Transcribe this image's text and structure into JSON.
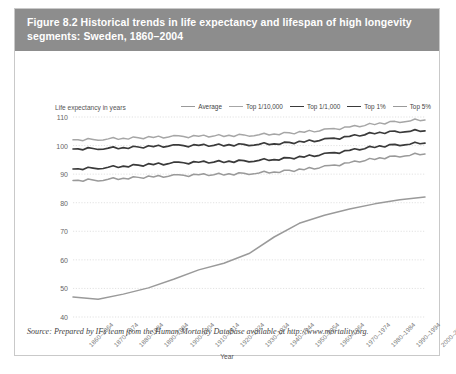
{
  "figure": {
    "title": "Figure 8.2 Historical trends in life expectancy and lifespan of high longevity segments: Sweden, 1860–2004",
    "source": "Source: Prepared by IFs team from the Human Mortality Database available at http://www.mortality.org."
  },
  "chart_data": {
    "type": "line",
    "title": "Figure 8.2 Historical trends in life expectancy and lifespan of high longevity segments: Sweden, 1860–2004",
    "xlabel": "Year",
    "ylabel": "Life expectancy in years",
    "ylim": [
      40,
      110
    ],
    "yticks": [
      40,
      50,
      60,
      70,
      80,
      90,
      100,
      110
    ],
    "grid": "horizontal-dotted",
    "legend_position": "top-right",
    "categories": [
      "1860–1864",
      "1870–1874",
      "1880–1884",
      "1890–1894",
      "1900–1904",
      "1910–1914",
      "1920–1924",
      "1930–1934",
      "1940–1944",
      "1950–1954",
      "1960–1964",
      "1970–1974",
      "1980–1984",
      "1990–1994",
      "2000–2004"
    ],
    "series": [
      {
        "name": "Average",
        "color": "#9a9a9a",
        "width": 1.5,
        "values": [
          47.0,
          46.2,
          48.0,
          50.2,
          53.2,
          56.5,
          58.8,
          62.2,
          68.0,
          72.8,
          75.6,
          77.8,
          79.6,
          81.0,
          82.0
        ]
      },
      {
        "name": "Top 1/10,000",
        "color": "#a6a6a6",
        "width": 1.5,
        "values": [
          102.0,
          102.2,
          102.6,
          102.8,
          103.1,
          103.2,
          103.5,
          103.7,
          104.1,
          104.6,
          105.4,
          106.4,
          107.6,
          108.5,
          109.1
        ]
      },
      {
        "name": "Top 1/1,000",
        "color": "#3a3a3a",
        "width": 1.7,
        "values": [
          98.8,
          99.0,
          99.3,
          99.6,
          99.9,
          100.0,
          100.2,
          100.4,
          100.7,
          101.2,
          102.0,
          103.1,
          104.4,
          105.0,
          105.3
        ]
      },
      {
        "name": "Top 1%",
        "color": "#3a3a3a",
        "width": 1.7,
        "values": [
          91.8,
          92.2,
          92.8,
          93.3,
          93.8,
          94.1,
          94.4,
          94.7,
          95.2,
          95.9,
          96.9,
          98.2,
          99.6,
          100.4,
          101.0
        ]
      },
      {
        "name": "Top 5%",
        "color": "#9a9a9a",
        "width": 1.5,
        "values": [
          87.8,
          88.0,
          88.6,
          89.0,
          89.4,
          89.7,
          90.0,
          90.3,
          90.8,
          91.5,
          92.5,
          93.9,
          95.4,
          96.4,
          97.2
        ]
      }
    ]
  }
}
